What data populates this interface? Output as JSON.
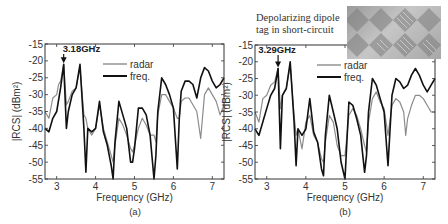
{
  "figure": {
    "panels": [
      {
        "id": "a",
        "caption": "(a)",
        "marker_label": "3.18GHz"
      },
      {
        "id": "b",
        "caption": "(b)",
        "marker_label": "3.29GHz"
      }
    ],
    "inset": {
      "line1": "Depolarizing dipole",
      "line2": "tag in short-circuit",
      "image": "photo of depolarizing dipole tag array"
    },
    "colors": {
      "radar": "#8c8c8c",
      "freq": "#111111",
      "axis": "#333333"
    }
  },
  "chart_data": [
    {
      "type": "line",
      "title": "(a)",
      "xlabel": "Frequency (GHz)",
      "ylabel": "|RCS| (dBm²)",
      "xlim": [
        2.7,
        7.3
      ],
      "ylim": [
        -55,
        -15
      ],
      "xticks": [
        3,
        4,
        5,
        6,
        7
      ],
      "yticks": [
        -15,
        -20,
        -25,
        -30,
        -35,
        -40,
        -45,
        -50,
        -55
      ],
      "grid": false,
      "legend": {
        "position": "upper center",
        "entries": [
          "radar",
          "freq."
        ]
      },
      "annotations": [
        {
          "text": "3.18GHz",
          "x": 3.18,
          "y": -21,
          "arrow": "down"
        }
      ],
      "series": [
        {
          "name": "radar",
          "x": [
            2.7,
            2.8,
            2.9,
            3.0,
            3.05,
            3.1,
            3.18,
            3.25,
            3.3,
            3.4,
            3.5,
            3.6,
            3.7,
            3.75,
            3.8,
            3.9,
            4.0,
            4.1,
            4.2,
            4.3,
            4.4,
            4.45,
            4.5,
            4.6,
            4.7,
            4.8,
            4.9,
            4.95,
            5.0,
            5.1,
            5.2,
            5.3,
            5.4,
            5.5,
            5.55,
            5.6,
            5.7,
            5.8,
            5.9,
            6.0,
            6.1,
            6.15,
            6.2,
            6.3,
            6.4,
            6.5,
            6.6,
            6.7,
            6.8,
            6.9,
            7.0,
            7.1,
            7.2,
            7.3
          ],
          "y": [
            -35,
            -37,
            -31,
            -30,
            -27,
            -26,
            -21,
            -33,
            -32,
            -29,
            -28,
            -22,
            -36,
            -37,
            -40,
            -42,
            -40,
            -33,
            -40,
            -44,
            -48,
            -50,
            -45,
            -37,
            -39,
            -42,
            -46,
            -47,
            -45,
            -40,
            -37,
            -39,
            -42,
            -42,
            -44,
            -36,
            -30,
            -30,
            -32,
            -34,
            -37,
            -37,
            -32,
            -31,
            -31,
            -33,
            -35,
            -43,
            -30,
            -28,
            -30,
            -32,
            -36,
            -33
          ]
        },
        {
          "name": "freq.",
          "x": [
            2.7,
            2.8,
            2.9,
            3.0,
            3.1,
            3.18,
            3.25,
            3.3,
            3.4,
            3.5,
            3.6,
            3.7,
            3.75,
            3.8,
            3.9,
            4.0,
            4.1,
            4.2,
            4.3,
            4.4,
            4.45,
            4.5,
            4.6,
            4.7,
            4.8,
            4.9,
            4.95,
            5.0,
            5.1,
            5.2,
            5.3,
            5.4,
            5.5,
            5.55,
            5.6,
            5.7,
            5.8,
            5.9,
            6.0,
            6.1,
            6.15,
            6.2,
            6.3,
            6.4,
            6.5,
            6.6,
            6.7,
            6.8,
            6.9,
            7.0,
            7.1,
            7.2,
            7.3
          ],
          "y": [
            -40,
            -41,
            -37,
            -35,
            -28,
            -21,
            -40,
            -35,
            -30,
            -28,
            -21,
            -40,
            -53,
            -40,
            -41,
            -40,
            -32,
            -41,
            -45,
            -51,
            -55,
            -44,
            -32,
            -36,
            -40,
            -50,
            -50,
            -46,
            -34,
            -34,
            -36,
            -42,
            -55,
            -48,
            -35,
            -25,
            -27,
            -30,
            -34,
            -52,
            -37,
            -29,
            -26,
            -26,
            -27,
            -31,
            -25,
            -22,
            -23,
            -26,
            -28,
            -27,
            -25
          ]
        }
      ]
    },
    {
      "type": "line",
      "title": "(b)",
      "xlabel": "Frequency (GHz)",
      "ylabel": "|RCS| (dBm²)",
      "xlim": [
        2.7,
        7.3
      ],
      "ylim": [
        -55,
        -15
      ],
      "xticks": [
        3,
        4,
        5,
        6,
        7
      ],
      "yticks": [
        -15,
        -20,
        -25,
        -30,
        -35,
        -40,
        -45,
        -50,
        -55
      ],
      "grid": false,
      "legend": {
        "position": "upper center",
        "entries": [
          "radar",
          "freq."
        ]
      },
      "annotations": [
        {
          "text": "3.29GHz",
          "x": 3.29,
          "y": -22,
          "arrow": "down"
        }
      ],
      "series": [
        {
          "name": "radar",
          "x": [
            2.7,
            2.8,
            2.9,
            3.0,
            3.1,
            3.2,
            3.29,
            3.35,
            3.4,
            3.5,
            3.6,
            3.7,
            3.75,
            3.8,
            3.9,
            4.0,
            4.1,
            4.2,
            4.3,
            4.4,
            4.45,
            4.5,
            4.6,
            4.7,
            4.8,
            4.9,
            5.0,
            5.1,
            5.2,
            5.3,
            5.4,
            5.5,
            5.55,
            5.6,
            5.7,
            5.8,
            5.9,
            6.0,
            6.1,
            6.2,
            6.3,
            6.4,
            6.5,
            6.55,
            6.6,
            6.7,
            6.8,
            6.9,
            7.0,
            7.1,
            7.2,
            7.3
          ],
          "y": [
            -35,
            -38,
            -31,
            -30,
            -27,
            -26,
            -22,
            -34,
            -30,
            -28,
            -21,
            -36,
            -42,
            -40,
            -46,
            -38,
            -36,
            -42,
            -44,
            -49,
            -50,
            -44,
            -36,
            -38,
            -45,
            -48,
            -48,
            -36,
            -34,
            -36,
            -40,
            -45,
            -47,
            -38,
            -31,
            -29,
            -32,
            -34,
            -42,
            -33,
            -31,
            -32,
            -35,
            -42,
            -37,
            -33,
            -30,
            -30,
            -31,
            -33,
            -35,
            -35
          ]
        },
        {
          "name": "freq.",
          "x": [
            2.7,
            2.8,
            2.9,
            3.0,
            3.1,
            3.2,
            3.29,
            3.35,
            3.4,
            3.5,
            3.6,
            3.7,
            3.75,
            3.8,
            3.9,
            4.0,
            4.1,
            4.2,
            4.3,
            4.4,
            4.45,
            4.5,
            4.6,
            4.7,
            4.8,
            4.9,
            5.0,
            5.1,
            5.2,
            5.3,
            5.4,
            5.5,
            5.55,
            5.6,
            5.7,
            5.8,
            5.9,
            6.0,
            6.1,
            6.2,
            6.3,
            6.4,
            6.5,
            6.6,
            6.7,
            6.8,
            6.9,
            7.0,
            7.1,
            7.2,
            7.3
          ],
          "y": [
            -40,
            -42,
            -38,
            -34,
            -30,
            -28,
            -22,
            -46,
            -30,
            -28,
            -20,
            -38,
            -51,
            -40,
            -42,
            -40,
            -31,
            -41,
            -44,
            -52,
            -54,
            -42,
            -30,
            -35,
            -40,
            -50,
            -55,
            -32,
            -33,
            -37,
            -42,
            -53,
            -48,
            -35,
            -25,
            -27,
            -31,
            -35,
            -51,
            -30,
            -25,
            -26,
            -28,
            -27,
            -24,
            -22,
            -24,
            -27,
            -29,
            -27,
            -25
          ]
        }
      ]
    }
  ]
}
